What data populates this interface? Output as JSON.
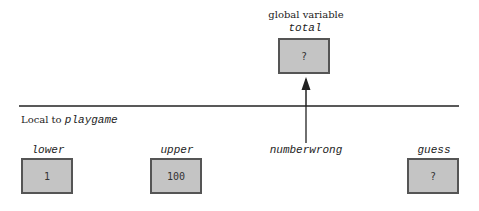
{
  "global": {
    "heading": "global variable",
    "variable": {
      "name": "total",
      "value": "?"
    }
  },
  "scope": {
    "label_prefix": "Local to ",
    "function_name": "playgame"
  },
  "locals": [
    {
      "name": "lower",
      "value": "1"
    },
    {
      "name": "upper",
      "value": "100"
    },
    {
      "name": "numberwrong",
      "value": null
    },
    {
      "name": "guess",
      "value": "?"
    }
  ],
  "colors": {
    "box_fill": "#c4c4c4",
    "box_border": "#555555",
    "line": "#222222"
  }
}
